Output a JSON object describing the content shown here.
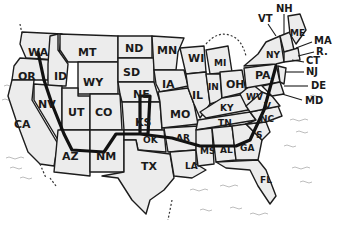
{
  "map": {
    "title_cropped": "…",
    "states": [
      {
        "code": "WA",
        "x": 30,
        "y": 52
      },
      {
        "code": "OR",
        "x": 20,
        "y": 76
      },
      {
        "code": "CA",
        "x": 16,
        "y": 124
      },
      {
        "code": "ID",
        "x": 56,
        "y": 76
      },
      {
        "code": "NV",
        "x": 40,
        "y": 104
      },
      {
        "code": "MT",
        "x": 80,
        "y": 52
      },
      {
        "code": "WY",
        "x": 85,
        "y": 82
      },
      {
        "code": "UT",
        "x": 70,
        "y": 112
      },
      {
        "code": "CO",
        "x": 97,
        "y": 112
      },
      {
        "code": "AZ",
        "x": 64,
        "y": 156
      },
      {
        "code": "NM",
        "x": 98,
        "y": 156
      },
      {
        "code": "ND",
        "x": 127,
        "y": 50
      },
      {
        "code": "SD",
        "x": 125,
        "y": 72
      },
      {
        "code": "NE",
        "x": 135,
        "y": 94
      },
      {
        "code": "KS",
        "x": 137,
        "y": 122
      },
      {
        "code": "OK",
        "x": 145,
        "y": 140
      },
      {
        "code": "TX",
        "x": 143,
        "y": 166
      },
      {
        "code": "MN",
        "x": 160,
        "y": 52
      },
      {
        "code": "IA",
        "x": 164,
        "y": 84
      },
      {
        "code": "MO",
        "x": 172,
        "y": 114
      },
      {
        "code": "AR",
        "x": 178,
        "y": 138
      },
      {
        "code": "LA",
        "x": 187,
        "y": 166
      },
      {
        "code": "WI",
        "x": 193,
        "y": 58
      },
      {
        "code": "IL",
        "x": 195,
        "y": 96
      },
      {
        "code": "MI",
        "x": 220,
        "y": 62
      },
      {
        "code": "IN",
        "x": 212,
        "y": 86
      },
      {
        "code": "OH",
        "x": 231,
        "y": 84
      },
      {
        "code": "KY",
        "x": 223,
        "y": 108
      },
      {
        "code": "TN",
        "x": 220,
        "y": 124
      },
      {
        "code": "MS",
        "x": 203,
        "y": 151
      },
      {
        "code": "AL",
        "x": 224,
        "y": 150
      },
      {
        "code": "GA",
        "x": 243,
        "y": 148
      },
      {
        "code": "FL",
        "x": 262,
        "y": 180
      },
      {
        "code": "SC",
        "x": 256,
        "y": 136
      },
      {
        "code": "NC",
        "x": 260,
        "y": 121
      },
      {
        "code": "WV",
        "x": 252,
        "y": 98
      },
      {
        "code": "VA",
        "x": 265,
        "y": 107
      },
      {
        "code": "PA",
        "x": 258,
        "y": 75
      },
      {
        "code": "NY",
        "x": 270,
        "y": 56
      },
      {
        "code": "ME",
        "x": 293,
        "y": 34
      }
    ],
    "callouts": [
      {
        "code": "VT",
        "x": 260,
        "y": 22
      },
      {
        "code": "NH",
        "x": 279,
        "y": 12
      },
      {
        "code": "MA",
        "x": 316,
        "y": 43
      },
      {
        "code": "RI",
        "x": 317,
        "y": 54
      },
      {
        "code": "CT",
        "x": 307,
        "y": 63
      },
      {
        "code": "NJ",
        "x": 308,
        "y": 74
      },
      {
        "code": "DE",
        "x": 313,
        "y": 88
      },
      {
        "code": "MD",
        "x": 307,
        "y": 103
      }
    ],
    "route_color": "#111111",
    "land_color": "#ececec",
    "border_color": "#1c1c1c"
  }
}
